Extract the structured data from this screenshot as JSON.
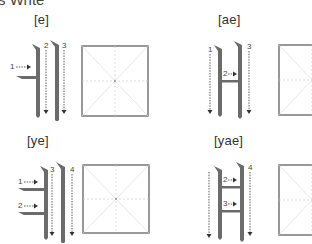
{
  "page": {
    "heading": "s Write"
  },
  "panels": [
    {
      "id": "e",
      "label": "[e]",
      "strokes": [
        {
          "number": "1",
          "direction": "right"
        },
        {
          "number": "2",
          "direction": "down"
        },
        {
          "number": "3",
          "direction": "down"
        }
      ]
    },
    {
      "id": "ae",
      "label": "[ae]",
      "strokes": [
        {
          "number": "1",
          "direction": "down"
        },
        {
          "number": "2",
          "direction": "right"
        },
        {
          "number": "3",
          "direction": "down"
        }
      ]
    },
    {
      "id": "ye",
      "label": "[ye]",
      "strokes": [
        {
          "number": "1",
          "direction": "right"
        },
        {
          "number": "2",
          "direction": "right"
        },
        {
          "number": "3",
          "direction": "down"
        },
        {
          "number": "4",
          "direction": "down"
        }
      ]
    },
    {
      "id": "yae",
      "label": "[yae]",
      "strokes": [
        {
          "number": "1",
          "direction": "down"
        },
        {
          "number": "2",
          "direction": "right"
        },
        {
          "number": "3",
          "direction": "right"
        },
        {
          "number": "4",
          "direction": "down"
        }
      ]
    }
  ],
  "colors": {
    "stroke_glyph": "#6b6b6b",
    "arrow": "#333333",
    "grid_border": "#555555",
    "grid_guide": "#cccccc"
  }
}
